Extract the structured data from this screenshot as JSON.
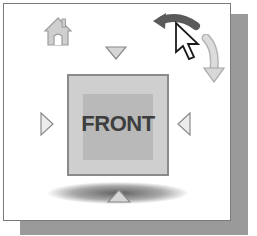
{
  "viewcube": {
    "face_label": "FRONT",
    "icons": {
      "home": "home-icon",
      "rotate_ccw": "rotate-counterclockwise-arrow-icon",
      "roll_cw": "roll-clockwise-arrow-icon",
      "cursor": "mouse-pointer-icon",
      "arrow_up": "triangle-down-icon",
      "arrow_down": "triangle-up-icon",
      "arrow_left": "triangle-right-icon",
      "arrow_right": "triangle-left-icon"
    },
    "colors": {
      "face": "#cfcfcf",
      "face_inner": "#b9b9b9",
      "label": "#3e3e3e",
      "shadow": "#9a9a9a",
      "triangles": "#d6d6d6"
    }
  }
}
